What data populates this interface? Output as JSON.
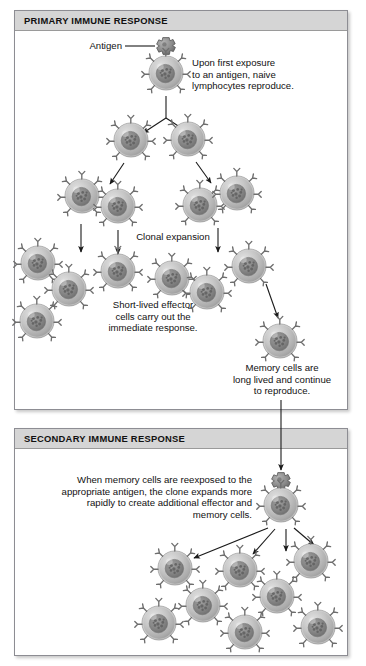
{
  "figure": {
    "background": "#ffffff",
    "header_bg": "#d5d5d5",
    "cell_body_color": "#b9b9b9",
    "cell_nucleus_color": "#8b8b8b",
    "arrow_color": "#1a1a1a",
    "panel_border": "#8d8d93"
  },
  "primary": {
    "header": "PRIMARY IMMUNE RESPONSE",
    "antigen_label": "Antigen",
    "first_exposure_text": "Upon first exposure\nto an antigen, naive\nlymphocytes reproduce.",
    "clonal_expansion_text": "Clonal expansion",
    "effector_text": "Short-lived effector\ncells carry out the\nimmediate response.",
    "memory_text": "Memory cells are\nlong lived and continue\nto reproduce.",
    "cells": [
      {
        "name": "naive-lymphocyte",
        "cx": 166,
        "cy": 73,
        "r": 17
      },
      {
        "name": "daughter-cell-left",
        "cx": 131,
        "cy": 140,
        "r": 17
      },
      {
        "name": "daughter-cell-right",
        "cx": 188,
        "cy": 139,
        "r": 17
      },
      {
        "name": "clone-cell-1",
        "cx": 82,
        "cy": 196,
        "r": 17
      },
      {
        "name": "clone-cell-2",
        "cx": 118,
        "cy": 206,
        "r": 17
      },
      {
        "name": "clone-cell-3",
        "cx": 200,
        "cy": 205,
        "r": 17
      },
      {
        "name": "clone-cell-4",
        "cx": 237,
        "cy": 193,
        "r": 17
      },
      {
        "name": "effector-cell-1",
        "cx": 38,
        "cy": 263,
        "r": 17
      },
      {
        "name": "effector-cell-2",
        "cx": 69,
        "cy": 289,
        "r": 17
      },
      {
        "name": "effector-cell-3",
        "cx": 37,
        "cy": 321,
        "r": 17
      },
      {
        "name": "effector-cell-4",
        "cx": 118,
        "cy": 271,
        "r": 17
      },
      {
        "name": "effector-cell-5",
        "cx": 172,
        "cy": 278,
        "r": 17
      },
      {
        "name": "effector-cell-6",
        "cx": 207,
        "cy": 292,
        "r": 17
      },
      {
        "name": "effector-cell-7",
        "cx": 249,
        "cy": 266,
        "r": 17
      },
      {
        "name": "memory-cell",
        "cx": 280,
        "cy": 341,
        "r": 17
      }
    ],
    "antigen": {
      "cx": 166,
      "cy": 46,
      "r": 8
    }
  },
  "secondary": {
    "header": "SECONDARY IMMUNE RESPONSE",
    "description": "When memory cells are reexposed to the\nappropriate antigen, the clone expands more\nrapidly to create additional effector and\nmemory cells.",
    "cells": [
      {
        "name": "reexposed-memory-cell",
        "cx": 281,
        "cy": 505,
        "r": 17
      },
      {
        "name": "secondary-clone-1",
        "cx": 175,
        "cy": 568,
        "r": 17
      },
      {
        "name": "secondary-clone-2",
        "cx": 240,
        "cy": 570,
        "r": 17
      },
      {
        "name": "secondary-clone-3",
        "cx": 311,
        "cy": 561,
        "r": 17
      },
      {
        "name": "secondary-clone-4",
        "cx": 277,
        "cy": 596,
        "r": 17
      },
      {
        "name": "secondary-clone-5",
        "cx": 203,
        "cy": 605,
        "r": 17
      },
      {
        "name": "secondary-clone-6",
        "cx": 159,
        "cy": 623,
        "r": 17
      },
      {
        "name": "secondary-clone-7",
        "cx": 245,
        "cy": 632,
        "r": 17
      },
      {
        "name": "secondary-clone-8",
        "cx": 318,
        "cy": 627,
        "r": 17
      }
    ],
    "antigen": {
      "cx": 281,
      "cy": 481,
      "r": 8
    }
  }
}
